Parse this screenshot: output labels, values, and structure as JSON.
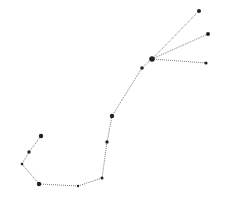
{
  "diagram": {
    "type": "constellation",
    "background": "#ffffff",
    "line_color": "#444444",
    "star_color": "#222222",
    "stars": [
      {
        "id": "s1",
        "x": 199,
        "y": 11,
        "r": 2.0
      },
      {
        "id": "s2",
        "x": 208,
        "y": 34,
        "r": 2.0
      },
      {
        "id": "s3",
        "x": 206,
        "y": 63,
        "r": 1.6
      },
      {
        "id": "s4",
        "x": 152,
        "y": 59,
        "r": 2.8
      },
      {
        "id": "s5",
        "x": 142,
        "y": 68,
        "r": 1.8
      },
      {
        "id": "s6",
        "x": 112,
        "y": 116,
        "r": 2.2
      },
      {
        "id": "s7",
        "x": 107,
        "y": 142,
        "r": 1.7
      },
      {
        "id": "s8",
        "x": 102,
        "y": 178,
        "r": 1.5
      },
      {
        "id": "s9",
        "x": 78,
        "y": 186,
        "r": 1.2
      },
      {
        "id": "s10",
        "x": 39,
        "y": 184,
        "r": 2.2
      },
      {
        "id": "s11",
        "x": 22,
        "y": 164,
        "r": 1.3
      },
      {
        "id": "s12",
        "x": 29,
        "y": 152,
        "r": 1.7
      },
      {
        "id": "s13",
        "x": 41,
        "y": 136,
        "r": 2.2
      }
    ],
    "edges": [
      [
        "s4",
        "s1"
      ],
      [
        "s4",
        "s2"
      ],
      [
        "s4",
        "s3"
      ],
      [
        "s4",
        "s5"
      ],
      [
        "s5",
        "s6"
      ],
      [
        "s6",
        "s7"
      ],
      [
        "s7",
        "s8"
      ],
      [
        "s8",
        "s9"
      ],
      [
        "s9",
        "s10"
      ],
      [
        "s10",
        "s11"
      ],
      [
        "s11",
        "s12"
      ],
      [
        "s12",
        "s13"
      ]
    ]
  }
}
